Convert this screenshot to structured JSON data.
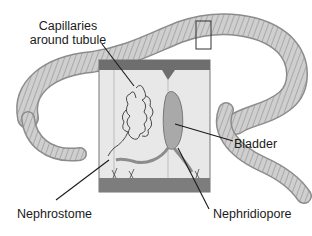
{
  "figure": {
    "labels": {
      "capillaries_line1": "Capillaries",
      "capillaries_line2": "around tubule",
      "bladder": "Bladder",
      "nephrostome": "Nephrostome",
      "nephridiopore": "Nephridiopore"
    },
    "colors": {
      "worm_fill": "#c9c9c9",
      "worm_shade": "#9a9a9a",
      "box_top": "#6e6e6e",
      "box_bottom": "#7a7a7a",
      "box_interior": "#e6e6e6",
      "leader_lines": "#1a1a1a"
    }
  }
}
